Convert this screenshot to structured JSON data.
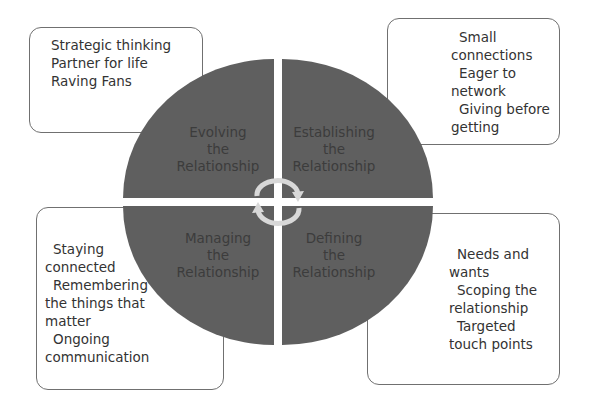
{
  "diagram": {
    "quadrants": [
      {
        "id": "top-left",
        "label": [
          "Evolving",
          "the",
          "Relationship"
        ]
      },
      {
        "id": "top-right",
        "label": [
          "Establishing",
          "the",
          "Relationship"
        ]
      },
      {
        "id": "bottom-left",
        "label": [
          "Managing",
          "the",
          "Relationship"
        ]
      },
      {
        "id": "bottom-right",
        "label": [
          "Defining",
          "the",
          "Relationship"
        ]
      }
    ],
    "boxes": {
      "top_left": {
        "lines": [
          "Strategic thinking",
          "Partner for life",
          "Raving Fans"
        ]
      },
      "top_right": {
        "lines": [
          "Small",
          "connections",
          "Eager to",
          "network",
          "Giving before",
          "getting"
        ]
      },
      "bottom_left": {
        "lines": [
          "Staying",
          "connected",
          "Remembering",
          "the things that",
          "matter",
          "Ongoing",
          "communication"
        ]
      },
      "bottom_right": {
        "lines": [
          "Needs and",
          "wants",
          "Scoping the",
          "relationship",
          "Targeted",
          "touch points"
        ]
      }
    },
    "center_icon": "cycle-arrows-icon",
    "colors": {
      "quadrant_fill": "#5f5f5f",
      "box_border": "#707070",
      "arrow": "#d8d8d8"
    }
  }
}
